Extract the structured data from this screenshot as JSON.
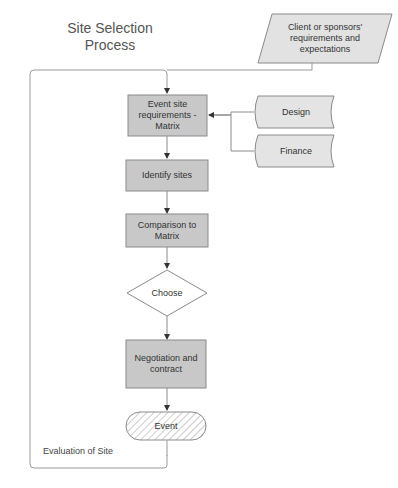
{
  "title": "Site Selection Process",
  "nodes": {
    "client": {
      "label": "Client or sponsors' requirements and expectations",
      "shape": "parallelogram"
    },
    "requirements": {
      "label": "Event site requirements - Matrix",
      "shape": "rectangle"
    },
    "design": {
      "label": "Design",
      "shape": "stored-data"
    },
    "finance": {
      "label": "Finance",
      "shape": "stored-data"
    },
    "identify": {
      "label": "Identify sites",
      "shape": "rectangle"
    },
    "comparison": {
      "label": "Comparison to Matrix",
      "shape": "rectangle"
    },
    "choose": {
      "label": "Choose",
      "shape": "diamond"
    },
    "negotiation": {
      "label": "Negotiation and contract",
      "shape": "rectangle"
    },
    "event": {
      "label": "Event",
      "shape": "terminator-hatched"
    }
  },
  "loop": {
    "label": "Evaluation of Site"
  },
  "edges": [
    [
      "client",
      "requirements"
    ],
    [
      "design",
      "requirements"
    ],
    [
      "finance",
      "requirements"
    ],
    [
      "requirements",
      "identify"
    ],
    [
      "identify",
      "comparison"
    ],
    [
      "comparison",
      "choose"
    ],
    [
      "choose",
      "negotiation"
    ],
    [
      "negotiation",
      "event"
    ],
    [
      "event",
      "requirements",
      "Evaluation of Site"
    ]
  ],
  "colors": {
    "box_fill": "#c8c8c8",
    "light_fill": "#e4e4e4",
    "stroke": "#8a8a8a",
    "line": "#7a7a7a"
  }
}
